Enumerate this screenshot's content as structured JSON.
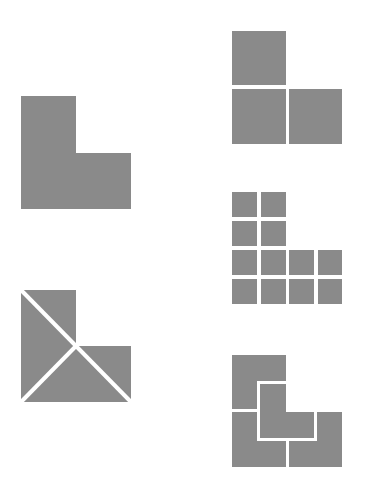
{
  "diagram": {
    "colors": {
      "fill": "#8a8a8a",
      "gap": "#ffffff",
      "background": "#ffffff"
    },
    "figures": [
      {
        "id": "solid-L",
        "description": "Solid L-tromino shape",
        "pieces": 1
      },
      {
        "id": "L-into-three-triangles",
        "description": "L shape cut into 3 pieces by lines through its inner corner",
        "pieces": 3
      },
      {
        "id": "L-into-three-squares",
        "description": "L shape made of 3 squares",
        "pieces": 3
      },
      {
        "id": "L-into-twelve-squares",
        "description": "L shape made of 12 small squares",
        "pieces": 12
      },
      {
        "id": "L-into-four-Ls",
        "description": "L shape tiled by 4 smaller L shapes",
        "pieces": 4
      }
    ]
  }
}
